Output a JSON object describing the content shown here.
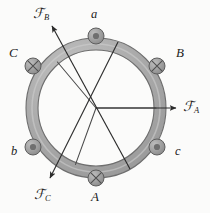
{
  "figure": {
    "type": "mechanical-schematic",
    "width": 210,
    "height": 213,
    "background_color": "#fbfbfa"
  },
  "ring": {
    "center": {
      "x": 96,
      "y": 108
    },
    "outer_radius": 70,
    "inner_radius": 58,
    "fill_color": "#a9a9a9",
    "inner_fill_color": "#fbfbfa",
    "stroke_color": "#6b6b6b",
    "highlight_color": "#c2c2c2"
  },
  "spokes": {
    "stroke_color": "#4a4a4a",
    "items": [
      {
        "name": "spoke-a",
        "angle_deg": 0,
        "length": 60
      },
      {
        "name": "spoke-b",
        "angle_deg": 130,
        "length": 60
      },
      {
        "name": "spoke-c",
        "angle_deg": 250,
        "length": 60
      }
    ]
  },
  "forces": [
    {
      "id": "FA",
      "symbol": "ℱ",
      "subscript": "A",
      "label": "ℱA",
      "angle_deg": 0,
      "tip": {
        "x": 178,
        "y": 108
      },
      "label_pos": {
        "x": 182,
        "y": 101
      }
    },
    {
      "id": "FB",
      "symbol": "ℱ",
      "subscript": "B",
      "label": "ℱB",
      "angle_deg": 130,
      "tip": {
        "x": 50,
        "y": 24
      },
      "label_pos": {
        "x": 31,
        "y": 8
      }
    },
    {
      "id": "FC",
      "symbol": "ℱ",
      "subscript": "C",
      "label": "ℱC",
      "angle_deg": 250,
      "tip": {
        "x": 47,
        "y": 180
      },
      "label_pos": {
        "x": 33,
        "y": 188
      }
    }
  ],
  "markers": [
    {
      "id": "a",
      "label": "a",
      "glyph": "dot-circle",
      "meaning": "current-out-of-page",
      "angle_deg": 90,
      "pos": {
        "x": 96,
        "y": 36
      },
      "radius": 8,
      "label_pos": {
        "x": 91,
        "y": 12
      },
      "label_class": "lbl-node"
    },
    {
      "id": "B",
      "label": "B",
      "glyph": "cross-circle",
      "meaning": "current-into-page",
      "angle_deg": 30,
      "pos": {
        "x": 157,
        "y": 66
      },
      "radius": 8,
      "label_pos": {
        "x": 176,
        "y": 50
      },
      "label_class": "lbl-node-upper"
    },
    {
      "id": "c",
      "label": "c",
      "glyph": "dot-circle",
      "meaning": "current-out-of-page",
      "angle_deg": -30,
      "pos": {
        "x": 157,
        "y": 147
      },
      "radius": 8,
      "label_pos": {
        "x": 175,
        "y": 150
      },
      "label_class": "lbl-node"
    },
    {
      "id": "A",
      "label": "A",
      "glyph": "cross-circle",
      "meaning": "current-into-page",
      "angle_deg": -90,
      "pos": {
        "x": 96,
        "y": 178
      },
      "radius": 8,
      "label_pos": {
        "x": 91,
        "y": 192
      },
      "label_class": "lbl-node-upper"
    },
    {
      "id": "b",
      "label": "b",
      "glyph": "dot-circle",
      "meaning": "current-out-of-page",
      "angle_deg": 210,
      "pos": {
        "x": 33,
        "y": 147
      },
      "radius": 8,
      "label_pos": {
        "x": 13,
        "y": 150
      },
      "label_class": "lbl-node"
    },
    {
      "id": "C",
      "label": "C",
      "glyph": "cross-circle",
      "meaning": "current-into-page",
      "angle_deg": 150,
      "pos": {
        "x": 33,
        "y": 66
      },
      "radius": 8,
      "label_pos": {
        "x": 10,
        "y": 50
      },
      "label_class": "lbl-node-upper"
    }
  ],
  "marker_style": {
    "fill_color": "#9a9a9a",
    "stroke_color": "#5e5e5e",
    "dot_color": "#6f6f6f",
    "cross_color": "#4f4f4f"
  }
}
